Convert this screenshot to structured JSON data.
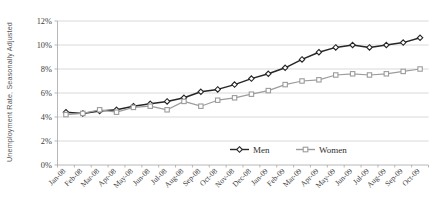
{
  "chart_data": {
    "type": "line",
    "title": "",
    "xlabel": "",
    "ylabel": "Unemployment Rate, Seasonally Adjusted",
    "ylim": [
      0,
      12
    ],
    "ytick_labels": [
      "0%",
      "2%",
      "4%",
      "6%",
      "8%",
      "10%",
      "12%"
    ],
    "ytick_values": [
      0,
      2,
      4,
      6,
      8,
      10,
      12
    ],
    "grid": true,
    "legend_position": "inside-bottom-center",
    "categories": [
      "Jan-08",
      "Feb-08",
      "Mar-08",
      "Apr-08",
      "May-08",
      "Jun-08",
      "Jul-08",
      "Aug-08",
      "Sep-08",
      "Oct-08",
      "Nov-08",
      "Dec-08",
      "Jan-09",
      "Feb-09",
      "Mar-09",
      "Apr-09",
      "May-09",
      "Jun-09",
      "Jul-09",
      "Aug-09",
      "Sep-09",
      "Oct-09"
    ],
    "series": [
      {
        "name": "Men",
        "color": "#262626",
        "marker": "diamond",
        "values": [
          4.4,
          4.3,
          4.5,
          4.6,
          4.9,
          5.1,
          5.3,
          5.6,
          6.1,
          6.3,
          6.7,
          7.2,
          7.6,
          8.1,
          8.8,
          9.4,
          9.8,
          10.0,
          9.8,
          10.0,
          10.2,
          10.6
        ]
      },
      {
        "name": "Women",
        "color": "#9c9c9c",
        "marker": "square",
        "values": [
          4.2,
          4.3,
          4.6,
          4.4,
          4.8,
          4.9,
          4.6,
          5.3,
          4.9,
          5.4,
          5.6,
          5.9,
          6.2,
          6.7,
          7.0,
          7.1,
          7.5,
          7.6,
          7.5,
          7.6,
          7.8,
          8.0
        ]
      }
    ]
  },
  "legend": {
    "items": [
      {
        "label": "Men"
      },
      {
        "label": "Women"
      }
    ]
  }
}
